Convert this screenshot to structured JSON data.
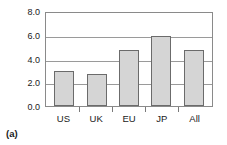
{
  "caption": "(a)",
  "chart_data": {
    "type": "bar",
    "title": "",
    "subtitle": "",
    "xlabel": "",
    "ylabel": "",
    "categories": [
      "US",
      "UK",
      "EU",
      "JP",
      "All"
    ],
    "values": [
      3.0,
      2.75,
      4.8,
      6.0,
      4.8
    ],
    "ylim": [
      0.0,
      8.0
    ],
    "ytick_values": [
      0.0,
      2.0,
      4.0,
      6.0,
      8.0
    ],
    "ytick_labels": [
      "0.0",
      "2.0",
      "4.0",
      "6.0",
      "8.0"
    ],
    "grid": true,
    "grid_axis": "y",
    "legend": false,
    "legend_position": "none",
    "bar_fill_color": "#d5d5d5",
    "bar_edge_color": "#6b6b6b",
    "gridline_color": "#9a9a9a",
    "frame_color": "#8a8a8a",
    "annotations": []
  }
}
